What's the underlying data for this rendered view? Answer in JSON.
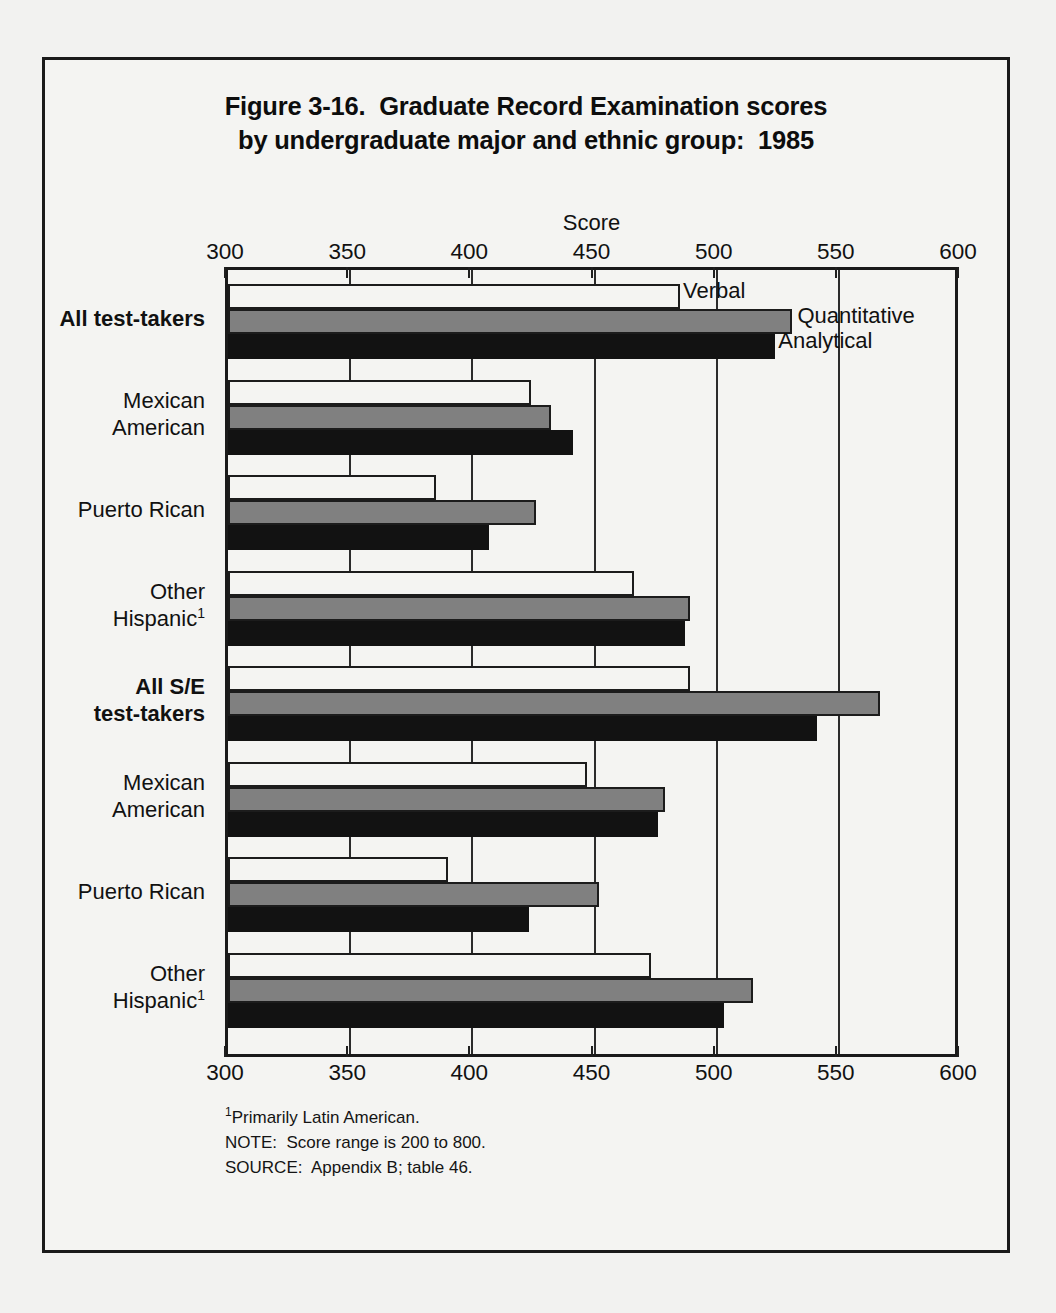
{
  "figure": {
    "title_line1": "Figure 3-16.  Graduate Record Examination scores",
    "title_line2": "by undergraduate major and ethnic group:  1985"
  },
  "footnotes": {
    "marker": "1",
    "footnote1": "Primarily Latin American.",
    "note": "NOTE:  Score range is 200 to 800.",
    "source": "SOURCE:  Appendix B; table 46."
  },
  "colors": {
    "verbal": "#f4f4f2",
    "quantitative": "#808080",
    "analytical": "#121212",
    "outline": "#1c1c1c",
    "background": "#f2f2f0",
    "frame": "#1a1a1a"
  },
  "chart_data": {
    "type": "bar",
    "orientation": "horizontal",
    "title": "Figure 3-16.  Graduate Record Examination scores by undergraduate major and ethnic group:  1985",
    "xlabel": "Score",
    "ylabel": "",
    "xlim": [
      300,
      600
    ],
    "xticks": [
      300,
      350,
      400,
      450,
      500,
      550,
      600
    ],
    "xtick_labels": [
      "300",
      "350",
      "400",
      "450",
      "500",
      "550",
      "600"
    ],
    "grid": true,
    "grid_axis": "x",
    "legend_position": "inline-first-group",
    "categories": [
      "All test-takers",
      "Mexican American",
      "Puerto Rican",
      "Other Hispanic¹",
      "All S/E test-takers",
      "Mexican American",
      "Puerto Rican",
      "Other Hispanic¹"
    ],
    "category_labels": [
      {
        "lines": [
          "All test-takers"
        ],
        "bold": true,
        "footnote": false
      },
      {
        "lines": [
          "Mexican",
          "American"
        ],
        "bold": false,
        "footnote": false
      },
      {
        "lines": [
          "Puerto Rican"
        ],
        "bold": false,
        "footnote": false
      },
      {
        "lines": [
          "Other",
          "Hispanic"
        ],
        "bold": false,
        "footnote": true
      },
      {
        "lines": [
          "All S/E",
          "test-takers"
        ],
        "bold": true,
        "footnote": false
      },
      {
        "lines": [
          "Mexican",
          "American"
        ],
        "bold": false,
        "footnote": false
      },
      {
        "lines": [
          "Puerto Rican"
        ],
        "bold": false,
        "footnote": false
      },
      {
        "lines": [
          "Other",
          "Hispanic"
        ],
        "bold": false,
        "footnote": true
      }
    ],
    "series": [
      {
        "name": "Verbal",
        "key": "verbal",
        "color": "#f4f4f2",
        "values": [
          485,
          424,
          385,
          466,
          489,
          447,
          390,
          473
        ]
      },
      {
        "name": "Quantitative",
        "key": "quantitative",
        "color": "#808080",
        "values": [
          531,
          432,
          426,
          489,
          567,
          479,
          452,
          515
        ]
      },
      {
        "name": "Analytical",
        "key": "analytical",
        "color": "#121212",
        "values": [
          524,
          441,
          407,
          487,
          541,
          476,
          423,
          503
        ]
      }
    ],
    "legend_entries": [
      "Verbal",
      "Quantitative",
      "Analytical"
    ],
    "annotations": [
      "¹Primarily Latin American.",
      "NOTE:  Score range is 200 to 800.",
      "SOURCE:  Appendix B; table 46."
    ]
  }
}
